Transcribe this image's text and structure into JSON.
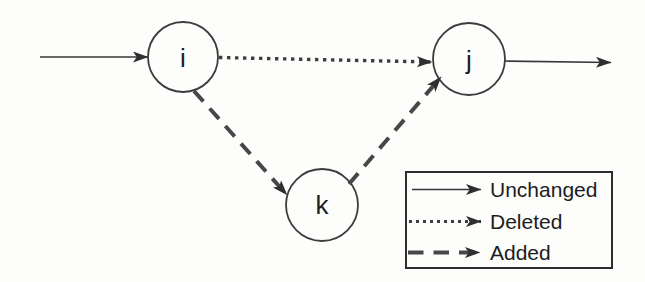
{
  "diagram": {
    "colors": {
      "background": "#fdfdfc",
      "stroke": "#383838",
      "text": "#1c1c1c"
    },
    "nodes": [
      {
        "id": "i",
        "label": "i"
      },
      {
        "id": "j",
        "label": "j"
      },
      {
        "id": "k",
        "label": "k"
      }
    ],
    "edges": [
      {
        "from": "external-left",
        "to": "i",
        "style": "solid",
        "meaning": "Unchanged"
      },
      {
        "from": "i",
        "to": "j",
        "style": "dotted",
        "meaning": "Deleted"
      },
      {
        "from": "i",
        "to": "k",
        "style": "dashed",
        "meaning": "Added"
      },
      {
        "from": "k",
        "to": "j",
        "style": "dashed",
        "meaning": "Added"
      },
      {
        "from": "j",
        "to": "external-right",
        "style": "solid",
        "meaning": "Unchanged"
      }
    ]
  },
  "legend": {
    "items": [
      {
        "style": "solid",
        "label": "Unchanged"
      },
      {
        "style": "dotted",
        "label": "Deleted"
      },
      {
        "style": "dashed",
        "label": "Added"
      }
    ]
  }
}
